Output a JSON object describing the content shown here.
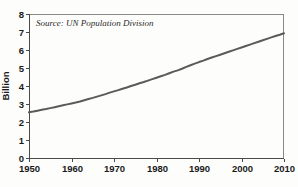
{
  "chart_data": {
    "type": "line",
    "title": "",
    "subtitle": "",
    "source_note": "Source: UN Population Division",
    "xlabel": "",
    "ylabel": "Billion",
    "xlim": [
      1950,
      2010
    ],
    "ylim": [
      0,
      8
    ],
    "grid": false,
    "legend": "none",
    "line_color": "#5a5a5a",
    "frame_color": "#8a8a8a",
    "axis_color": "#4a4a4a",
    "background_color": "#fdfdfc",
    "x_ticks": [
      "1950",
      "1960",
      "1970",
      "1980",
      "1990",
      "2000",
      "2010"
    ],
    "x_tick_values": [
      1950,
      1960,
      1970,
      1980,
      1990,
      2000,
      2010
    ],
    "y_ticks": [
      "0",
      "1",
      "2",
      "3",
      "4",
      "5",
      "6",
      "7",
      "8"
    ],
    "y_tick_values": [
      0,
      1,
      2,
      3,
      4,
      5,
      6,
      7,
      8
    ],
    "series": [
      {
        "name": "World population",
        "x": [
          1950,
          1951,
          1952,
          1953,
          1954,
          1955,
          1956,
          1957,
          1958,
          1959,
          1960,
          1961,
          1962,
          1963,
          1964,
          1965,
          1966,
          1967,
          1968,
          1969,
          1970,
          1971,
          1972,
          1973,
          1974,
          1975,
          1976,
          1977,
          1978,
          1979,
          1980,
          1981,
          1982,
          1983,
          1984,
          1985,
          1986,
          1987,
          1988,
          1989,
          1990,
          1991,
          1992,
          1993,
          1994,
          1995,
          1996,
          1997,
          1998,
          1999,
          2000,
          2001,
          2002,
          2003,
          2004,
          2005,
          2006,
          2007,
          2008,
          2009,
          2010
        ],
        "values": [
          2.54,
          2.58,
          2.63,
          2.68,
          2.72,
          2.77,
          2.82,
          2.88,
          2.93,
          2.98,
          3.03,
          3.08,
          3.14,
          3.21,
          3.28,
          3.34,
          3.41,
          3.48,
          3.55,
          3.63,
          3.7,
          3.77,
          3.85,
          3.92,
          4.0,
          4.07,
          4.15,
          4.22,
          4.3,
          4.38,
          4.46,
          4.54,
          4.62,
          4.71,
          4.8,
          4.87,
          4.96,
          5.06,
          5.15,
          5.24,
          5.33,
          5.41,
          5.5,
          5.58,
          5.66,
          5.74,
          5.82,
          5.9,
          5.98,
          6.06,
          6.14,
          6.22,
          6.3,
          6.38,
          6.46,
          6.54,
          6.62,
          6.7,
          6.78,
          6.85,
          6.93
        ]
      }
    ]
  },
  "layout": {
    "plot_left": 29,
    "plot_right": 284,
    "plot_top": 14,
    "plot_bottom": 158
  }
}
